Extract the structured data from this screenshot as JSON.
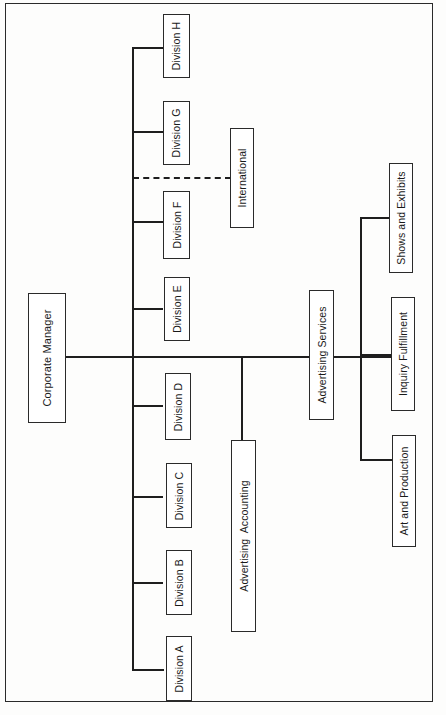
{
  "chart": {
    "type": "organization-chart",
    "orientation": "rotated-90-ccw",
    "root": {
      "label": "Corporate Manager",
      "children": [
        {
          "label": "Division A"
        },
        {
          "label": "Division B"
        },
        {
          "label": "Division C"
        },
        {
          "label": "Division D"
        },
        {
          "label": "Division E"
        },
        {
          "label": "Division F"
        },
        {
          "label": "Division G"
        },
        {
          "label": "Division H"
        },
        {
          "label": "International",
          "relationship": "dotted-line"
        },
        {
          "label": "Advertising Accounting"
        },
        {
          "label": "Advertising Services",
          "children": [
            {
              "label": "Art and Production"
            },
            {
              "label": "Inquiry Fulfillment"
            },
            {
              "label": "Shows and Exhibits"
            }
          ]
        }
      ]
    }
  },
  "nodes": {
    "corporate_manager": "Corporate Manager",
    "division_a": "Division A",
    "division_b": "Division B",
    "division_c": "Division C",
    "division_d": "Division D",
    "division_e": "Division E",
    "division_f": "Division F",
    "division_g": "Division G",
    "division_h": "Division H",
    "international": "International",
    "advertising_accounting": "Advertising  Accounting",
    "advertising_services": "Advertising Services",
    "art_and_production": "Art and Production",
    "inquiry_fulfillment": "Inquiry Fulfillment",
    "shows_and_exhibits": "Shows and Exhibits"
  },
  "colors": {
    "line": "#1e1e1e",
    "box_border": "#2a2a2a",
    "background": "#fdfdfc"
  }
}
